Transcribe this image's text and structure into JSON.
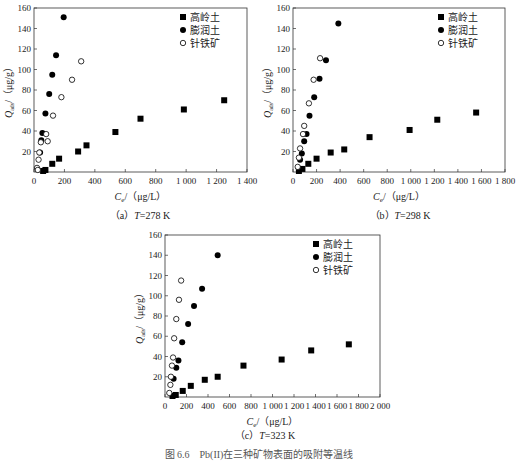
{
  "figure_caption": "图 6.6　Pb(II)在三种矿物表面的吸附等温线",
  "legend": {
    "items": [
      {
        "label": "高岭土",
        "marker": "filled-square"
      },
      {
        "label": "膨润土",
        "marker": "filled-circle"
      },
      {
        "label": "针铁矿",
        "marker": "open-circle"
      }
    ]
  },
  "panels": [
    {
      "caption_prefix": "（a）",
      "caption_T": "T",
      "caption_value": "=278 K"
    },
    {
      "caption_prefix": "（b）",
      "caption_T": "T",
      "caption_value": "=298 K"
    },
    {
      "caption_prefix": "（c）",
      "caption_T": "T",
      "caption_value": "=323 K"
    }
  ],
  "chart_data": [
    {
      "type": "scatter",
      "title": "(a) T=278 K",
      "xlabel": "Ce/(μg/L)",
      "ylabel": "Qads/(μg/g)",
      "xlim": [
        0,
        1400
      ],
      "ylim": [
        0,
        160
      ],
      "xticks": [
        0,
        200,
        400,
        600,
        800,
        1000,
        1200,
        1400
      ],
      "xtick_labels": [
        "0",
        "200",
        "400",
        "600",
        "800",
        "1 000",
        "1 200",
        "1 400"
      ],
      "yticks": [
        20,
        40,
        60,
        80,
        100,
        120,
        140,
        160
      ],
      "legend_position": "upper right",
      "grid": false,
      "series": [
        {
          "name": "高岭土",
          "marker": "filled-square",
          "points": [
            [
              60,
              1
            ],
            [
              75,
              2
            ],
            [
              120,
              8
            ],
            [
              165,
              13
            ],
            [
              290,
              20
            ],
            [
              345,
              26
            ],
            [
              535,
              39
            ],
            [
              700,
              52
            ],
            [
              985,
              61
            ],
            [
              1250,
              70
            ]
          ]
        },
        {
          "name": "膨润土",
          "marker": "filled-circle",
          "points": [
            [
              40,
              19
            ],
            [
              48,
              31
            ],
            [
              55,
              38
            ],
            [
              75,
              57
            ],
            [
              100,
              76
            ],
            [
              120,
              95
            ],
            [
              145,
              114
            ],
            [
              195,
              151
            ]
          ]
        },
        {
          "name": "针铁矿",
          "marker": "open-circle",
          "points": [
            [
              20,
              4
            ],
            [
              25,
              2
            ],
            [
              30,
              12
            ],
            [
              35,
              19
            ],
            [
              45,
              29
            ],
            [
              80,
              37
            ],
            [
              90,
              30
            ],
            [
              125,
              55
            ],
            [
              180,
              73
            ],
            [
              250,
              90
            ],
            [
              310,
              108
            ]
          ]
        }
      ]
    },
    {
      "type": "scatter",
      "title": "(b) T=298 K",
      "xlabel": "Ce/(μg/L)",
      "ylabel": "Qads/(μg/g)",
      "xlim": [
        0,
        1800
      ],
      "ylim": [
        0,
        160
      ],
      "xticks": [
        0,
        200,
        400,
        600,
        800,
        1000,
        1200,
        1400,
        1600,
        1800
      ],
      "xtick_labels": [
        "0",
        "200",
        "400",
        "600",
        "800",
        "1 000",
        "1 200",
        "1 400",
        "1 600",
        "1 800"
      ],
      "yticks": [
        20,
        40,
        60,
        80,
        100,
        120,
        140,
        160
      ],
      "legend_position": "upper right",
      "grid": false,
      "series": [
        {
          "name": "高岭土",
          "marker": "filled-square",
          "points": [
            [
              50,
              1
            ],
            [
              80,
              3
            ],
            [
              130,
              8
            ],
            [
              200,
              13
            ],
            [
              320,
              19
            ],
            [
              435,
              22
            ],
            [
              650,
              34
            ],
            [
              990,
              41
            ],
            [
              1225,
              51
            ],
            [
              1555,
              58
            ]
          ]
        },
        {
          "name": "膨润土",
          "marker": "filled-circle",
          "points": [
            [
              60,
              12
            ],
            [
              75,
              18
            ],
            [
              95,
              30
            ],
            [
              115,
              37
            ],
            [
              140,
              55
            ],
            [
              180,
              73
            ],
            [
              225,
              91
            ],
            [
              280,
              109
            ],
            [
              385,
              145
            ]
          ]
        },
        {
          "name": "针铁矿",
          "marker": "open-circle",
          "points": [
            [
              40,
              5
            ],
            [
              50,
              14
            ],
            [
              60,
              23
            ],
            [
              85,
              37
            ],
            [
              95,
              45
            ],
            [
              135,
              67
            ],
            [
              175,
              90
            ],
            [
              230,
              111
            ]
          ]
        }
      ]
    },
    {
      "type": "scatter",
      "title": "(c) T=323 K",
      "xlabel": "Ce/(μg/L)",
      "ylabel": "Qads/(μg/g)",
      "xlim": [
        0,
        2000
      ],
      "ylim": [
        0,
        160
      ],
      "xticks": [
        0,
        200,
        400,
        600,
        800,
        1000,
        1200,
        1400,
        1600,
        1800,
        2000
      ],
      "xtick_labels": [
        "0",
        "200",
        "400",
        "600",
        "800",
        "1 000",
        "1 200",
        "1 400",
        "1 600",
        "1 800",
        "2 000"
      ],
      "yticks": [
        20,
        40,
        60,
        80,
        100,
        120,
        140,
        160
      ],
      "legend_position": "upper right",
      "grid": false,
      "series": [
        {
          "name": "高岭土",
          "marker": "filled-square",
          "points": [
            [
              70,
              1
            ],
            [
              100,
              2
            ],
            [
              165,
              6
            ],
            [
              240,
              11
            ],
            [
              370,
              17
            ],
            [
              490,
              20
            ],
            [
              730,
              31
            ],
            [
              1085,
              37
            ],
            [
              1360,
              46
            ],
            [
              1710,
              52
            ]
          ]
        },
        {
          "name": "膨润土",
          "marker": "filled-circle",
          "points": [
            [
              80,
              18
            ],
            [
              105,
              29
            ],
            [
              125,
              36
            ],
            [
              160,
              54
            ],
            [
              215,
              72
            ],
            [
              270,
              90
            ],
            [
              345,
              107
            ],
            [
              490,
              140
            ]
          ]
        },
        {
          "name": "针铁矿",
          "marker": "open-circle",
          "points": [
            [
              40,
              4
            ],
            [
              50,
              12
            ],
            [
              55,
              20
            ],
            [
              65,
              31
            ],
            [
              75,
              39
            ],
            [
              85,
              58
            ],
            [
              105,
              77
            ],
            [
              130,
              96
            ],
            [
              150,
              115
            ]
          ]
        }
      ]
    }
  ]
}
